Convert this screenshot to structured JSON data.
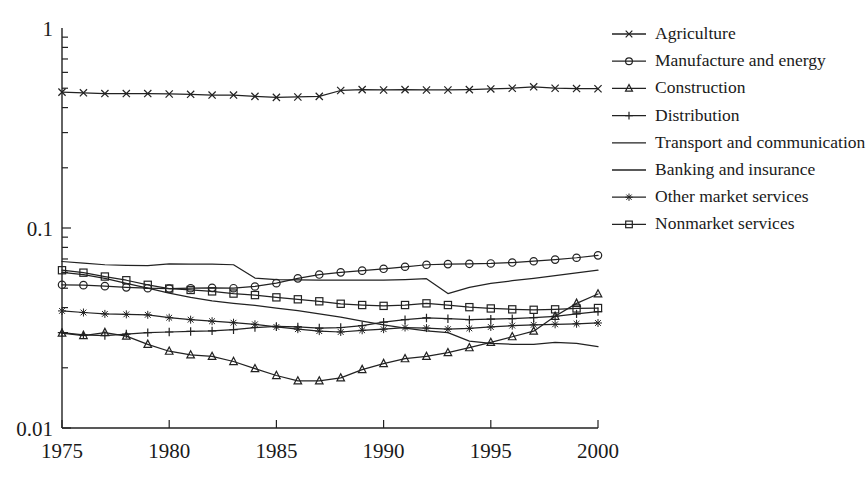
{
  "chart_data": {
    "type": "line",
    "title": "",
    "xlabel": "",
    "ylabel": "",
    "yscale": "log",
    "ylim": [
      0.01,
      1
    ],
    "xlim": [
      1975,
      2000
    ],
    "grid": false,
    "legend_position": "right",
    "y_tick_labels": [
      "1",
      "0.1",
      "0.01"
    ],
    "y_tick_values": [
      1,
      0.1,
      0.01
    ],
    "x_tick_labels": [
      "1975",
      "1980",
      "1985",
      "1990",
      "1995",
      "2000"
    ],
    "x_tick_values": [
      1975,
      1980,
      1985,
      1990,
      1995,
      2000
    ],
    "x": [
      1975,
      1976,
      1977,
      1978,
      1979,
      1980,
      1981,
      1982,
      1983,
      1984,
      1985,
      1986,
      1987,
      1988,
      1989,
      1990,
      1991,
      1992,
      1993,
      1994,
      1995,
      1996,
      1997,
      1998,
      1999,
      2000
    ],
    "series": [
      {
        "name": "Agriculture",
        "marker": "x",
        "values": [
          0.478,
          0.474,
          0.47,
          0.47,
          0.47,
          0.468,
          0.466,
          0.462,
          0.462,
          0.455,
          0.45,
          0.452,
          0.455,
          0.487,
          0.492,
          0.49,
          0.492,
          0.49,
          0.49,
          0.492,
          0.496,
          0.5,
          0.508,
          0.5,
          0.498,
          0.497
        ]
      },
      {
        "name": "Manufacture and energy",
        "marker": "circle",
        "values": [
          0.052,
          0.0518,
          0.0512,
          0.0505,
          0.05,
          0.0498,
          0.05,
          0.0502,
          0.05,
          0.051,
          0.053,
          0.056,
          0.0585,
          0.06,
          0.0612,
          0.0625,
          0.064,
          0.0655,
          0.066,
          0.0662,
          0.0665,
          0.0672,
          0.0682,
          0.0695,
          0.071,
          0.073
        ]
      },
      {
        "name": "Construction",
        "marker": "triangle",
        "values": [
          0.0298,
          0.029,
          0.03,
          0.0288,
          0.0262,
          0.0242,
          0.0232,
          0.0228,
          0.0215,
          0.0198,
          0.0183,
          0.0172,
          0.0172,
          0.0178,
          0.0196,
          0.021,
          0.0222,
          0.0228,
          0.0238,
          0.0252,
          0.0268,
          0.0286,
          0.0305,
          0.0362,
          0.042,
          0.0468
        ]
      },
      {
        "name": "Distribution",
        "marker": "plus",
        "values": [
          0.03,
          0.0292,
          0.029,
          0.0295,
          0.03,
          0.0302,
          0.0304,
          0.0306,
          0.031,
          0.0318,
          0.0322,
          0.032,
          0.0316,
          0.0318,
          0.0325,
          0.0338,
          0.0348,
          0.0355,
          0.0352,
          0.0348,
          0.035,
          0.0352,
          0.0356,
          0.0362,
          0.0372,
          0.0382
        ]
      },
      {
        "name": "Transport and communication",
        "marker": "none",
        "values": [
          0.068,
          0.0668,
          0.0655,
          0.065,
          0.0648,
          0.0662,
          0.066,
          0.066,
          0.0655,
          0.0562,
          0.0552,
          0.055,
          0.0548,
          0.0548,
          0.0548,
          0.0548,
          0.0552,
          0.0558,
          0.047,
          0.0505,
          0.0528,
          0.0545,
          0.056,
          0.0578,
          0.0596,
          0.0615
        ]
      },
      {
        "name": "Banking and insurance",
        "marker": "none",
        "values": [
          0.06,
          0.0585,
          0.056,
          0.0528,
          0.05,
          0.0472,
          0.045,
          0.0432,
          0.042,
          0.041,
          0.0398,
          0.0386,
          0.0372,
          0.0358,
          0.0342,
          0.0328,
          0.0316,
          0.0306,
          0.03,
          0.0272,
          0.0265,
          0.0262,
          0.0262,
          0.0268,
          0.0265,
          0.0255
        ]
      },
      {
        "name": "Other market services",
        "marker": "star",
        "values": [
          0.0385,
          0.0378,
          0.0372,
          0.037,
          0.0368,
          0.0356,
          0.0348,
          0.0342,
          0.0336,
          0.033,
          0.032,
          0.0312,
          0.0305,
          0.0302,
          0.0308,
          0.0312,
          0.0318,
          0.0316,
          0.0312,
          0.0315,
          0.032,
          0.0325,
          0.0328,
          0.033,
          0.0332,
          0.0335
        ]
      },
      {
        "name": "Nonmarket services",
        "marker": "square",
        "values": [
          0.0615,
          0.0598,
          0.0572,
          0.0548,
          0.052,
          0.0498,
          0.049,
          0.0482,
          0.047,
          0.0462,
          0.045,
          0.044,
          0.043,
          0.0418,
          0.0412,
          0.0408,
          0.0412,
          0.042,
          0.0412,
          0.0402,
          0.0396,
          0.0392,
          0.039,
          0.0392,
          0.0396,
          0.0398
        ]
      }
    ]
  },
  "legend": {
    "items": [
      {
        "label": "Agriculture",
        "marker": "x"
      },
      {
        "label": "Manufacture and energy",
        "marker": "circle"
      },
      {
        "label": "Construction",
        "marker": "triangle"
      },
      {
        "label": "Distribution",
        "marker": "plus"
      },
      {
        "label": "Transport and communication",
        "marker": "none"
      },
      {
        "label": "Banking and insurance",
        "marker": "none"
      },
      {
        "label": "Other market services",
        "marker": "star"
      },
      {
        "label": "Nonmarket services",
        "marker": "square"
      }
    ]
  },
  "colors": {
    "ink": "#222222",
    "background": "#ffffff"
  }
}
